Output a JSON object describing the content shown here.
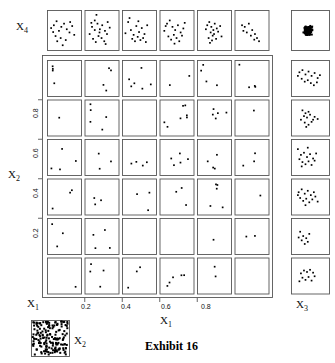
{
  "figure": {
    "caption": "Exhibit 16",
    "labels": {
      "x1": "X",
      "x1_sub": "1",
      "x2": "X",
      "x2_sub": "2",
      "x3": "X",
      "x3_sub": "3",
      "x4": "X",
      "x4_sub": "4"
    },
    "x_ticks": [
      "0.2",
      "0.4",
      "0.6",
      "0.8"
    ],
    "y_ticks": [
      "0.8",
      "0.6",
      "0.4",
      "0.2"
    ],
    "colors": {
      "ink": "#111111",
      "frame": "#555555",
      "point": "#000000",
      "background": "#ffffff"
    }
  },
  "chart_data": {
    "type": "scatter",
    "title": "Exhibit 16",
    "xlabel": "X1",
    "ylabel": "X2",
    "grid": false,
    "legend": null,
    "layout": "conditioned scatterplot matrix (casement display): 6x6 grid of X3 vs X4 panels conditioned on X1 (columns) and X2 (rows), with X4 marginal row on top, X3 marginal column on right, dense X1-X2 marginal inset at bottom-left",
    "xlim": [
      0,
      1
    ],
    "ylim": [
      0,
      1
    ],
    "conditioning": {
      "columns_variable": "X1",
      "rows_variable": "X2",
      "columns": 6,
      "rows": 6,
      "panel_x_variable": "X3",
      "panel_y_variable": "X4"
    },
    "panels": {
      "top_row": [
        {
          "index": 0,
          "points": [
            [
              0.12,
              0.55
            ],
            [
              0.2,
              0.62
            ],
            [
              0.28,
              0.72
            ],
            [
              0.35,
              0.48
            ],
            [
              0.42,
              0.58
            ],
            [
              0.25,
              0.35
            ],
            [
              0.5,
              0.66
            ],
            [
              0.58,
              0.52
            ],
            [
              0.66,
              0.44
            ],
            [
              0.74,
              0.6
            ],
            [
              0.3,
              0.22
            ],
            [
              0.4,
              0.3
            ],
            [
              0.55,
              0.25
            ],
            [
              0.68,
              0.7
            ],
            [
              0.18,
              0.45
            ],
            [
              0.46,
              0.12
            ],
            [
              0.8,
              0.38
            ]
          ]
        },
        {
          "index": 1,
          "points": [
            [
              0.15,
              0.4
            ],
            [
              0.22,
              0.58
            ],
            [
              0.3,
              0.74
            ],
            [
              0.38,
              0.66
            ],
            [
              0.45,
              0.52
            ],
            [
              0.52,
              0.62
            ],
            [
              0.6,
              0.48
            ],
            [
              0.68,
              0.7
            ],
            [
              0.25,
              0.28
            ],
            [
              0.33,
              0.2
            ],
            [
              0.41,
              0.35
            ],
            [
              0.5,
              0.3
            ],
            [
              0.58,
              0.22
            ],
            [
              0.66,
              0.4
            ],
            [
              0.74,
              0.56
            ],
            [
              0.35,
              0.88
            ],
            [
              0.2,
              0.68
            ],
            [
              0.44,
              0.44
            ],
            [
              0.62,
              0.15
            ],
            [
              0.3,
              0.5
            ]
          ]
        },
        {
          "index": 2,
          "points": [
            [
              0.1,
              0.42
            ],
            [
              0.18,
              0.7
            ],
            [
              0.26,
              0.5
            ],
            [
              0.34,
              0.38
            ],
            [
              0.42,
              0.6
            ],
            [
              0.5,
              0.45
            ],
            [
              0.58,
              0.55
            ],
            [
              0.66,
              0.4
            ],
            [
              0.74,
              0.62
            ],
            [
              0.3,
              0.28
            ],
            [
              0.38,
              0.22
            ],
            [
              0.46,
              0.33
            ],
            [
              0.54,
              0.25
            ],
            [
              0.62,
              0.3
            ],
            [
              0.22,
              0.8
            ],
            [
              0.7,
              0.2
            ],
            [
              0.48,
              0.72
            ]
          ]
        },
        {
          "index": 3,
          "points": [
            [
              0.14,
              0.48
            ],
            [
              0.22,
              0.66
            ],
            [
              0.3,
              0.74
            ],
            [
              0.38,
              0.58
            ],
            [
              0.46,
              0.5
            ],
            [
              0.54,
              0.62
            ],
            [
              0.62,
              0.44
            ],
            [
              0.7,
              0.54
            ],
            [
              0.26,
              0.34
            ],
            [
              0.34,
              0.26
            ],
            [
              0.42,
              0.38
            ],
            [
              0.5,
              0.3
            ],
            [
              0.58,
              0.22
            ],
            [
              0.66,
              0.36
            ],
            [
              0.18,
              0.6
            ],
            [
              0.44,
              0.16
            ],
            [
              0.74,
              0.68
            ]
          ]
        },
        {
          "index": 4,
          "points": [
            [
              0.3,
              0.62
            ],
            [
              0.36,
              0.7
            ],
            [
              0.42,
              0.58
            ],
            [
              0.48,
              0.5
            ],
            [
              0.4,
              0.44
            ],
            [
              0.46,
              0.36
            ],
            [
              0.52,
              0.66
            ],
            [
              0.58,
              0.54
            ],
            [
              0.34,
              0.3
            ],
            [
              0.44,
              0.24
            ],
            [
              0.5,
              0.4
            ],
            [
              0.56,
              0.28
            ],
            [
              0.62,
              0.46
            ],
            [
              0.26,
              0.52
            ],
            [
              0.68,
              0.6
            ],
            [
              0.38,
              0.18
            ],
            [
              0.72,
              0.34
            ]
          ]
        },
        {
          "index": 5,
          "points": [
            [
              0.22,
              0.62
            ],
            [
              0.3,
              0.58
            ],
            [
              0.42,
              0.66
            ],
            [
              0.52,
              0.5
            ],
            [
              0.6,
              0.4
            ],
            [
              0.66,
              0.3
            ],
            [
              0.72,
              0.22
            ],
            [
              0.36,
              0.44
            ],
            [
              0.48,
              0.36
            ],
            [
              0.58,
              0.26
            ],
            [
              0.26,
              0.48
            ]
          ]
        }
      ],
      "top_right_corner": {
        "label": "X3 vs X4 marginal",
        "density": "dense cluster, ~120 points centered near (0.45,0.5)"
      },
      "right_column": [
        {
          "index": 0,
          "points": [
            [
              0.22,
              0.66
            ],
            [
              0.3,
              0.72
            ],
            [
              0.38,
              0.6
            ],
            [
              0.46,
              0.68
            ],
            [
              0.54,
              0.56
            ],
            [
              0.62,
              0.64
            ],
            [
              0.7,
              0.5
            ],
            [
              0.28,
              0.48
            ],
            [
              0.36,
              0.4
            ],
            [
              0.44,
              0.44
            ],
            [
              0.52,
              0.36
            ],
            [
              0.6,
              0.3
            ],
            [
              0.18,
              0.56
            ],
            [
              0.68,
              0.38
            ],
            [
              0.76,
              0.58
            ]
          ]
        },
        {
          "index": 1,
          "points": [
            [
              0.3,
              0.7
            ],
            [
              0.38,
              0.62
            ],
            [
              0.46,
              0.66
            ],
            [
              0.34,
              0.54
            ],
            [
              0.42,
              0.5
            ],
            [
              0.5,
              0.58
            ],
            [
              0.58,
              0.44
            ],
            [
              0.26,
              0.44
            ],
            [
              0.36,
              0.36
            ],
            [
              0.46,
              0.3
            ],
            [
              0.54,
              0.38
            ],
            [
              0.62,
              0.52
            ],
            [
              0.7,
              0.46
            ],
            [
              0.4,
              0.24
            ]
          ]
        },
        {
          "index": 2,
          "points": [
            [
              0.18,
              0.72
            ],
            [
              0.26,
              0.56
            ],
            [
              0.34,
              0.62
            ],
            [
              0.42,
              0.5
            ],
            [
              0.5,
              0.58
            ],
            [
              0.58,
              0.46
            ],
            [
              0.22,
              0.44
            ],
            [
              0.3,
              0.36
            ],
            [
              0.38,
              0.3
            ],
            [
              0.46,
              0.38
            ],
            [
              0.54,
              0.28
            ],
            [
              0.62,
              0.4
            ],
            [
              0.44,
              0.76
            ],
            [
              0.66,
              0.6
            ],
            [
              0.28,
              0.24
            ]
          ]
        },
        {
          "index": 3,
          "points": [
            [
              0.2,
              0.62
            ],
            [
              0.28,
              0.7
            ],
            [
              0.36,
              0.58
            ],
            [
              0.44,
              0.66
            ],
            [
              0.52,
              0.54
            ],
            [
              0.6,
              0.62
            ],
            [
              0.24,
              0.46
            ],
            [
              0.32,
              0.38
            ],
            [
              0.4,
              0.44
            ],
            [
              0.48,
              0.34
            ],
            [
              0.56,
              0.42
            ],
            [
              0.64,
              0.5
            ],
            [
              0.18,
              0.54
            ],
            [
              0.7,
              0.36
            ],
            [
              0.38,
              0.26
            ]
          ]
        },
        {
          "index": 4,
          "points": [
            [
              0.24,
              0.62
            ],
            [
              0.32,
              0.5
            ],
            [
              0.28,
              0.38
            ],
            [
              0.4,
              0.44
            ],
            [
              0.36,
              0.28
            ],
            [
              0.48,
              0.56
            ],
            [
              0.44,
              0.34
            ],
            [
              0.2,
              0.46
            ]
          ]
        },
        {
          "index": 5,
          "points": [
            [
              0.26,
              0.56
            ],
            [
              0.34,
              0.64
            ],
            [
              0.42,
              0.6
            ],
            [
              0.5,
              0.66
            ],
            [
              0.58,
              0.58
            ],
            [
              0.3,
              0.44
            ],
            [
              0.38,
              0.38
            ],
            [
              0.46,
              0.46
            ],
            [
              0.54,
              0.36
            ],
            [
              0.22,
              0.34
            ],
            [
              0.62,
              0.48
            ]
          ]
        }
      ],
      "bottom_left_inset": {
        "label": "X1 vs X2 marginal",
        "density": "very dense scatter, ~150 points filling the panel"
      }
    }
  }
}
